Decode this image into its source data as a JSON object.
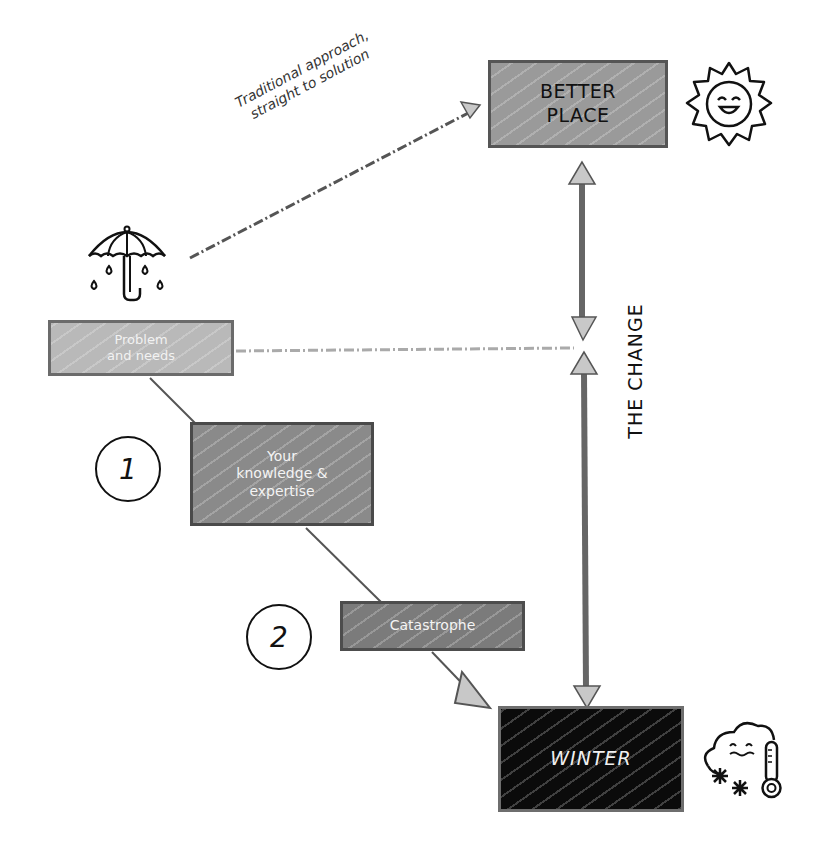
{
  "diagram": {
    "nodes": {
      "better_place": {
        "label": "BETTER\nPLACE",
        "line1": "BETTER",
        "line2": "PLACE"
      },
      "problem": {
        "line1": "Problem",
        "line2": "and needs"
      },
      "knowledge": {
        "line1": "Your",
        "line2": "knowledge &",
        "line3": "expertise"
      },
      "catastrophe": {
        "label": "Catastrophe"
      },
      "winter": {
        "label": "WINTER"
      }
    },
    "labels": {
      "traditional_line1": "Traditional approach,",
      "traditional_line2": "straight to solution",
      "the_change": "THE CHANGE"
    },
    "steps": {
      "step1": "1",
      "step2": "2"
    },
    "icons": {
      "better_place_icon": "smiling-sun-icon",
      "problem_icon": "umbrella-rain-icon",
      "winter_icon": "cold-cloud-thermometer-icon"
    },
    "colors": {
      "better_place_fill": "#9a9a9a",
      "problem_fill": "#b9b9b9",
      "knowledge_fill": "#8a8a8a",
      "catastrophe_fill": "#7b7b7b",
      "winter_fill": "#0b0b0b",
      "arrow_head_fill": "#c8c8c8",
      "line_color": "#555555"
    },
    "edges": [
      {
        "from": "problem",
        "to": "better_place",
        "style": "dash-dot",
        "label": "Traditional approach, straight to solution"
      },
      {
        "from": "problem",
        "to": "the_change",
        "style": "dash-dot"
      },
      {
        "from": "problem",
        "to": "knowledge",
        "style": "solid"
      },
      {
        "from": "knowledge",
        "to": "catastrophe",
        "style": "solid"
      },
      {
        "from": "catastrophe",
        "to": "winter",
        "style": "solid-arrow"
      },
      {
        "from": "winter",
        "to": "better_place",
        "style": "thick-double-arrow",
        "label": "THE CHANGE"
      }
    ]
  }
}
